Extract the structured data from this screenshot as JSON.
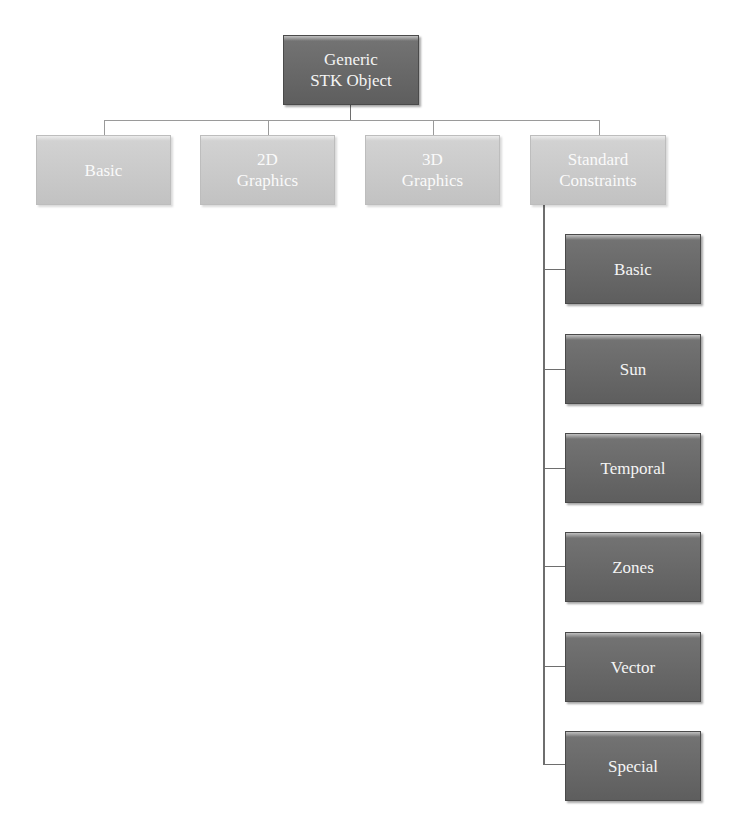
{
  "diagram": {
    "type": "hierarchy",
    "root": {
      "label": "Generic STK Object",
      "lines": [
        "Generic",
        "STK Object"
      ],
      "color": "#6a6a6a"
    },
    "level1": [
      {
        "label": "Basic",
        "lines": [
          "Basic"
        ],
        "color": "#c8c8c8"
      },
      {
        "label": "2D Graphics",
        "lines": [
          "2D",
          "Graphics"
        ],
        "color": "#c8c8c8"
      },
      {
        "label": "3D Graphics",
        "lines": [
          "3D",
          "Graphics"
        ],
        "color": "#c8c8c8"
      },
      {
        "label": "Standard Constraints",
        "lines": [
          "Standard",
          "Constraints"
        ],
        "color": "#c8c8c8"
      }
    ],
    "constraints_children": [
      {
        "label": "Basic",
        "color": "#646464"
      },
      {
        "label": "Sun",
        "color": "#646464"
      },
      {
        "label": "Temporal",
        "color": "#646464"
      },
      {
        "label": "Zones",
        "color": "#646464"
      },
      {
        "label": "Vector",
        "color": "#646464"
      },
      {
        "label": "Special",
        "color": "#646464"
      }
    ],
    "connector_color": "#9a9a9a"
  }
}
